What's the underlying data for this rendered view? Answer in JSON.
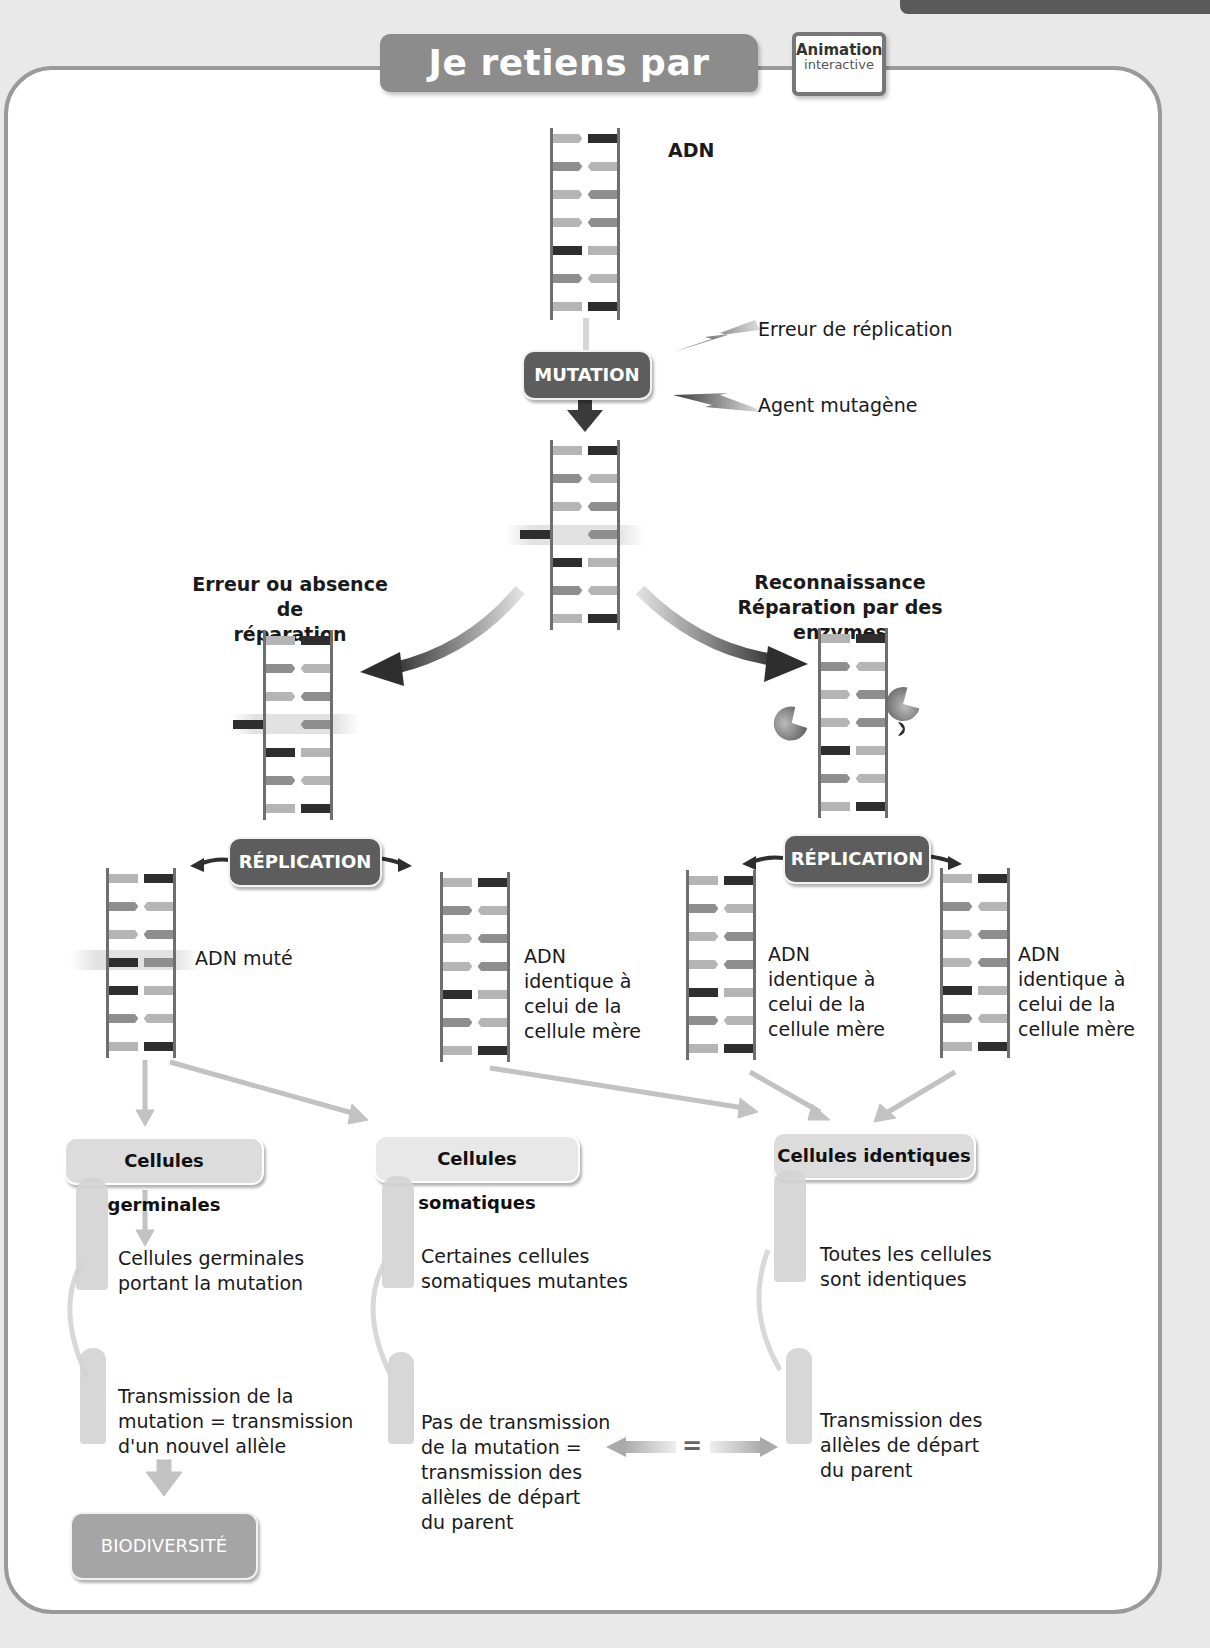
{
  "header": {
    "title": "Je retiens par l'image",
    "badge": {
      "line1": "Animation",
      "line2": "interactive"
    }
  },
  "top": {
    "dna_label": "ADN",
    "mutation_label": "MUTATION",
    "causes": [
      "Erreur de réplication",
      "Agent mutagène"
    ]
  },
  "branches": {
    "left": {
      "heading_line1": "Erreur ou absence de",
      "heading_line2": "réparation"
    },
    "right": {
      "heading_line1": "Reconnaissance",
      "heading_line2": "Réparation par des enzymes"
    }
  },
  "replication": {
    "label": "RÉPLICATION"
  },
  "daughter_dna": {
    "mutated": "ADN muté",
    "identical": {
      "line1": "ADN",
      "line2": "identique à",
      "line3": "celui de la",
      "line4": "cellule mère"
    }
  },
  "categories": [
    {
      "title": "Cellules germinales",
      "adult_text": [
        "Cellules germinales",
        "portant la mutation"
      ],
      "child_text": [
        "Transmission de la",
        "mutation = transmission",
        "d'un nouvel allèle"
      ]
    },
    {
      "title": "Cellules somatiques",
      "adult_text": [
        "Certaines cellules",
        "somatiques mutantes"
      ],
      "child_text": [
        "Pas de transmission",
        "de la mutation =",
        "transmission des",
        "allèles de départ",
        "du parent"
      ]
    },
    {
      "title": "Cellules identiques",
      "adult_text": [
        "Toutes les cellules",
        "sont identiques"
      ],
      "child_text": [
        "Transmission des",
        "allèles de départ",
        "du parent"
      ]
    }
  ],
  "equals_sign": "=",
  "outcome": {
    "label": "BIODIVERSITÉ"
  },
  "icons": {
    "lightning": "lightning-bolt",
    "enzyme": "pacman-enzyme",
    "adult": "adult-silhouette",
    "child": "child-silhouette"
  },
  "colors": {
    "panel_border": "#9a9a9a",
    "pill_dark": "#5d5d5d",
    "pill_light": "#dcdcdc",
    "title_bg": "#8c8c8c"
  }
}
